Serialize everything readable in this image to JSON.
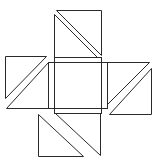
{
  "diagram": {
    "title": "",
    "stroke_color": "#2a2a2a",
    "background": "#ffffff",
    "shapes": {
      "center_square_a": {
        "x": 54,
        "y": 57,
        "w": 47,
        "h": 56
      },
      "center_square_b": {
        "x": 48,
        "y": 62,
        "w": 59,
        "h": 46
      },
      "top_flap": {
        "square": [
          54,
          10,
          101,
          57
        ],
        "triangles": [
          "56,12 101,12 101,55",
          "54,14 54,57 97,57"
        ]
      },
      "left_flap": {
        "square": [
          5,
          56,
          48,
          108
        ],
        "triangles": [
          "5,56 46,56 5,98",
          "48,62 48,108 8,108"
        ]
      },
      "right_flap": {
        "square": [
          107,
          62,
          151,
          114
        ],
        "triangles": [
          "107,62 149,62 107,104",
          "151,68 151,114 110,114"
        ]
      },
      "bottom_flap": {
        "square": [
          38,
          113,
          101,
          156
        ],
        "triangles": [
          "38,113 38,156 82,156",
          "54,113 101,113 101,155"
        ]
      }
    }
  }
}
